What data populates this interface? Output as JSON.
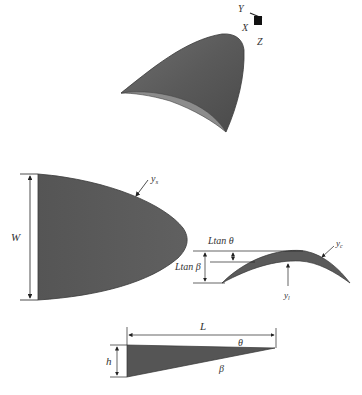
{
  "figure": {
    "axes_triad": {
      "labels": {
        "y": "Y",
        "x": "X",
        "z": "Z"
      }
    },
    "top_view": {
      "width_label": "W",
      "surface_label": "y",
      "surface_sub": "s"
    },
    "cross_section": {
      "ltan_theta_label": "Ltan θ",
      "ltan_beta_label": "Ltan β",
      "camber_label": "y",
      "camber_sub": "c",
      "lower_label": "y",
      "lower_sub": "l"
    },
    "side_view": {
      "length_label": "L",
      "height_label": "h",
      "theta_label": "θ",
      "beta_label": "β"
    },
    "colors": {
      "surface_fill": "#5a5a5a",
      "surface_edge": "#3c3c3c",
      "highlight": "#8a8a8a",
      "line": "#222222"
    }
  }
}
